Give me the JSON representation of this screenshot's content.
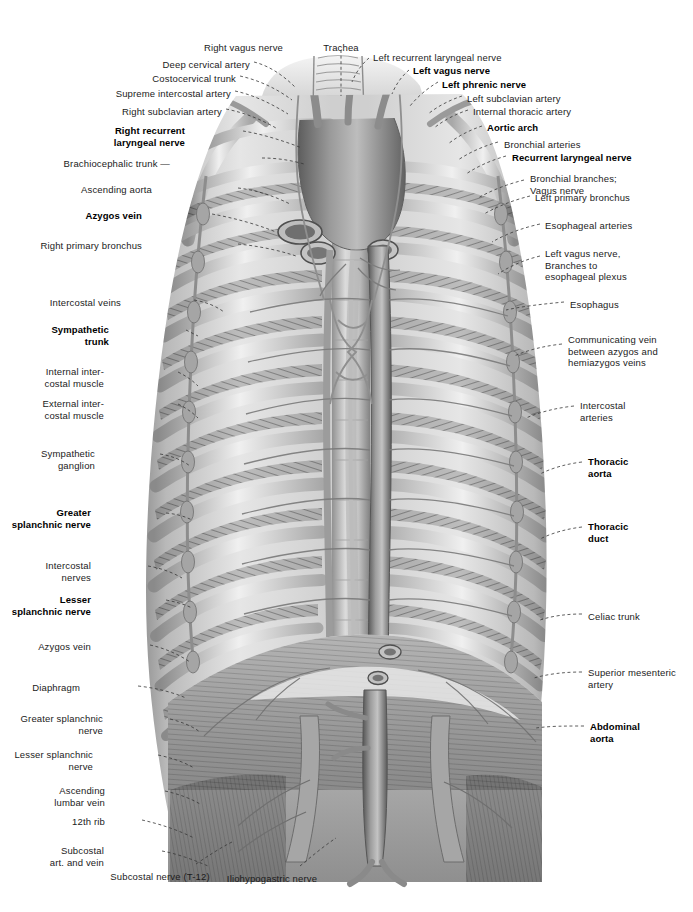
{
  "plate": {
    "title": "Posterior thoracic wall, mediastinum and diaphragm — anterior view",
    "background_color": "#ffffff",
    "ink_color": "#1b1b1b",
    "leader_color": "#3a3a3a",
    "width": 693,
    "height": 912
  },
  "labels_top": [
    {
      "id": "right-vagus-nerve",
      "text": "Right vagus nerve",
      "bold": false,
      "align": "right",
      "x": 283,
      "y": 42
    },
    {
      "id": "trachea",
      "text": "Trachea",
      "bold": false,
      "align": "center",
      "x": 341,
      "y": 42
    },
    {
      "id": "left-recurrent-laryngeal-nerve",
      "text": "Left recurrent laryngeal nerve",
      "bold": false,
      "align": "left",
      "x": 373,
      "y": 52
    },
    {
      "id": "left-vagus-nerve",
      "text": "Left vagus nerve",
      "bold": true,
      "align": "left",
      "x": 413,
      "y": 65
    }
  ],
  "labels_left": [
    {
      "id": "deep-cervical-artery",
      "text": "Deep cervical artery",
      "bold": false,
      "x": 250,
      "y": 59
    },
    {
      "id": "costocervical-trunk",
      "text": "Costocervical trunk",
      "bold": false,
      "x": 236,
      "y": 73
    },
    {
      "id": "supreme-intercostal-artery",
      "text": "Supreme intercostal artery",
      "bold": false,
      "x": 231,
      "y": 88
    },
    {
      "id": "right-subclavian-artery",
      "text": "Right subclavian artery",
      "bold": false,
      "x": 222,
      "y": 106
    },
    {
      "id": "right-recurrent-laryngeal-nerve",
      "text": "Right recurrent\nlaryngeal nerve",
      "bold": true,
      "x": 185,
      "y": 125
    },
    {
      "id": "brachiocephalic-trunk",
      "text": "Brachiocephalic trunk —",
      "bold": false,
      "x": 170,
      "y": 158
    },
    {
      "id": "ascending-aorta",
      "text": "Ascending aorta",
      "bold": false,
      "x": 152,
      "y": 184
    },
    {
      "id": "azygos-vein-upper",
      "text": "Azygos vein",
      "bold": true,
      "x": 142,
      "y": 210
    },
    {
      "id": "right-primary-bronchus",
      "text": "Right primary bronchus",
      "bold": false,
      "x": 142,
      "y": 240
    },
    {
      "id": "intercostal-veins",
      "text": "Intercostal veins",
      "bold": false,
      "x": 121,
      "y": 297
    },
    {
      "id": "sympathetic-trunk",
      "text": "Sympathetic\ntrunk",
      "bold": true,
      "x": 109,
      "y": 324
    },
    {
      "id": "internal-intercostal-muscle",
      "text": "Internal inter-\ncostal muscle",
      "bold": false,
      "x": 104,
      "y": 366
    },
    {
      "id": "external-intercostal-muscle",
      "text": "External inter-\ncostal muscle",
      "bold": false,
      "x": 104,
      "y": 398
    },
    {
      "id": "sympathetic-ganglion",
      "text": "Sympathetic\nganglion",
      "bold": false,
      "x": 95,
      "y": 448
    },
    {
      "id": "greater-splanchnic-nerve",
      "text": "Greater\nsplanchnic nerve",
      "bold": true,
      "x": 91,
      "y": 507
    },
    {
      "id": "intercostal-nerves",
      "text": "Intercostal\nnerves",
      "bold": false,
      "x": 91,
      "y": 560
    },
    {
      "id": "lesser-splanchnic-nerve",
      "text": "Lesser\nsplanchnic nerve",
      "bold": true,
      "x": 91,
      "y": 594
    },
    {
      "id": "azygos-vein-lower",
      "text": "Azygos vein",
      "bold": false,
      "x": 91,
      "y": 641
    },
    {
      "id": "diaphragm",
      "text": "Diaphragm",
      "bold": false,
      "x": 80,
      "y": 682
    },
    {
      "id": "greater-splanchnic-nerve-2",
      "text": "Greater splanchnic\nnerve",
      "bold": false,
      "x": 103,
      "y": 713
    },
    {
      "id": "lesser-splanchnic-nerve-2",
      "text": "Lesser splanchnic\nnerve",
      "bold": false,
      "x": 93,
      "y": 749
    },
    {
      "id": "ascending-lumbar-vein",
      "text": "Ascending\nlumbar vein",
      "bold": false,
      "x": 105,
      "y": 785
    },
    {
      "id": "twelfth-rib",
      "text": "12th rib",
      "bold": false,
      "x": 105,
      "y": 816
    },
    {
      "id": "subcostal-art-and-vein",
      "text": "Subcostal\nart. and vein",
      "bold": false,
      "x": 104,
      "y": 845
    }
  ],
  "labels_right": [
    {
      "id": "left-phrenic-nerve",
      "text": "Left phrenic nerve",
      "bold": true,
      "x": 442,
      "y": 79
    },
    {
      "id": "left-subclavian-artery",
      "text": "Left subclavian artery",
      "bold": false,
      "x": 467,
      "y": 93
    },
    {
      "id": "internal-thoracic-artery",
      "text": "Internal thoracic artery",
      "bold": false,
      "x": 473,
      "y": 106
    },
    {
      "id": "aortic-arch",
      "text": "Aortic arch",
      "bold": true,
      "x": 487,
      "y": 122
    },
    {
      "id": "bronchial-arteries",
      "text": "Bronchial arteries",
      "bold": false,
      "x": 504,
      "y": 139
    },
    {
      "id": "recurrent-laryngeal-nerve",
      "text": "Recurrent laryngeal nerve",
      "bold": true,
      "x": 512,
      "y": 152
    },
    {
      "id": "bronchial-branches-vagus-nerve",
      "text": "Bronchial branches;\nVagus nerve",
      "bold": false,
      "x": 530,
      "y": 173
    },
    {
      "id": "left-primary-bronchus",
      "text": "Left primary bronchus",
      "bold": false,
      "x": 535,
      "y": 192
    },
    {
      "id": "esophageal-arteries",
      "text": "Esophageal arteries",
      "bold": false,
      "x": 545,
      "y": 220
    },
    {
      "id": "left-vagus-nerve-branches",
      "text": "Left vagus nerve,\nBranches to\nesophageal plexus",
      "bold": false,
      "x": 545,
      "y": 248
    },
    {
      "id": "esophagus",
      "text": "Esophagus",
      "bold": false,
      "x": 570,
      "y": 299
    },
    {
      "id": "communicating-vein",
      "text": "Communicating vein\nbetween azygos and\nhemiazygos veins",
      "bold": false,
      "x": 568,
      "y": 334
    },
    {
      "id": "intercostal-arteries",
      "text": "Intercostal\narteries",
      "bold": false,
      "x": 580,
      "y": 400
    },
    {
      "id": "thoracic-aorta",
      "text": "Thoracic\naorta",
      "bold": true,
      "x": 588,
      "y": 456
    },
    {
      "id": "thoracic-duct",
      "text": "Thoracic\nduct",
      "bold": true,
      "x": 588,
      "y": 521
    },
    {
      "id": "celiac-trunk",
      "text": "Celiac trunk",
      "bold": false,
      "x": 588,
      "y": 611
    },
    {
      "id": "superior-mesenteric-artery",
      "text": "Superior mesenteric\nartery",
      "bold": false,
      "x": 588,
      "y": 667
    },
    {
      "id": "abdominal-aorta",
      "text": "Abdominal\naorta",
      "bold": true,
      "x": 590,
      "y": 721
    }
  ],
  "labels_bottom": [
    {
      "id": "subcostal-nerve-t12",
      "text": "Subcostal nerve (T-12)",
      "bold": false,
      "align": "center",
      "x": 160,
      "y": 871
    },
    {
      "id": "iliohypogastric-nerve",
      "text": "Iliohypogastric nerve",
      "bold": false,
      "align": "center",
      "x": 272,
      "y": 873
    }
  ]
}
